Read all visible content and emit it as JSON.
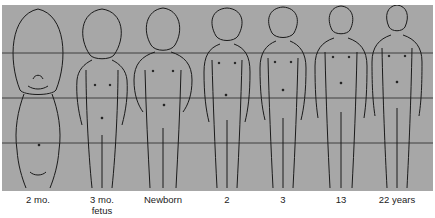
{
  "figure": {
    "background": "#a7a7a7",
    "line_color": "#222222",
    "guide_lines_y": [
      53,
      98,
      143
    ],
    "stages": [
      {
        "label": "2 mo.",
        "sublabel": "",
        "cx": 38
      },
      {
        "label": "3 mo.",
        "sublabel": "fetus",
        "cx": 102
      },
      {
        "label": "Newborn",
        "sublabel": "",
        "cx": 163
      },
      {
        "label": "2",
        "sublabel": "",
        "cx": 227
      },
      {
        "label": "3",
        "sublabel": "",
        "cx": 283
      },
      {
        "label": "13",
        "sublabel": "",
        "cx": 341
      },
      {
        "label": "22 years",
        "sublabel": "",
        "cx": 397
      }
    ]
  }
}
